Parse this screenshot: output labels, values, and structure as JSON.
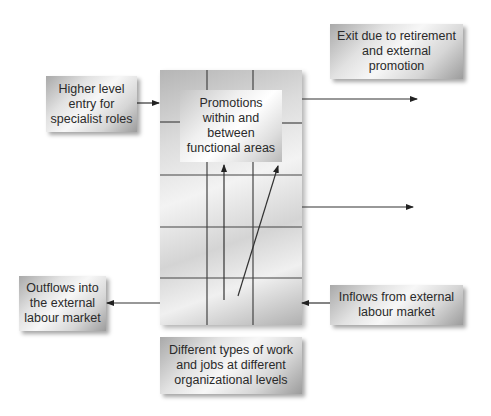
{
  "diagram": {
    "type": "flow-diagram",
    "central_box": {
      "label": "Promotions\nwithin and\nbetween\nfunctional areas"
    },
    "boxes": [
      {
        "id": "higher-level-entry",
        "label": "Higher level\nentry for\nspecialist roles",
        "flow": "into central box"
      },
      {
        "id": "exit-retirement",
        "label": "Exit due to retirement\nand external\npromotion",
        "flow": "out of central box"
      },
      {
        "id": "outflows-external",
        "label": "Outflows into\nthe external\nlabour market",
        "flow": "out of central box"
      },
      {
        "id": "inflows-external",
        "label": "Inflows from external\nlabour market",
        "flow": "into central box"
      },
      {
        "id": "different-types",
        "label": "Different types of work\nand jobs at different\norganizational levels",
        "flow": "caption for central grid"
      }
    ],
    "colors": {
      "box_dark": "#9c9c9c",
      "box_light": "#f7f7f7",
      "line": "#333333",
      "text": "#2a2a2a"
    }
  }
}
